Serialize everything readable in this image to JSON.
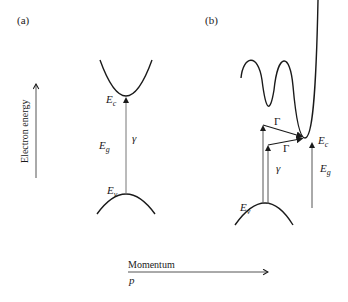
{
  "panels": {
    "a": {
      "label": "(a)"
    },
    "b": {
      "label": "(b)"
    }
  },
  "axes": {
    "y_label": "Electron energy",
    "x_label": "Momentum",
    "x_symbol": "p"
  },
  "panel_a": {
    "conduction_band_label": "E",
    "conduction_band_sub": "c",
    "valence_band_label": "E",
    "valence_band_sub": "v",
    "gap_label": "E",
    "gap_sub": "g",
    "photon_label": "γ"
  },
  "panel_b": {
    "conduction_band_label": "E",
    "conduction_band_sub": "c",
    "valence_band_label": "E",
    "valence_band_sub": "v",
    "gap_label": "E",
    "gap_sub": "g",
    "photon_label": "γ",
    "phonon_label_upper": "Γ",
    "phonon_label_lower": "Γ"
  },
  "colors": {
    "curve": "#1a1a1a",
    "arrow": "#555555"
  }
}
